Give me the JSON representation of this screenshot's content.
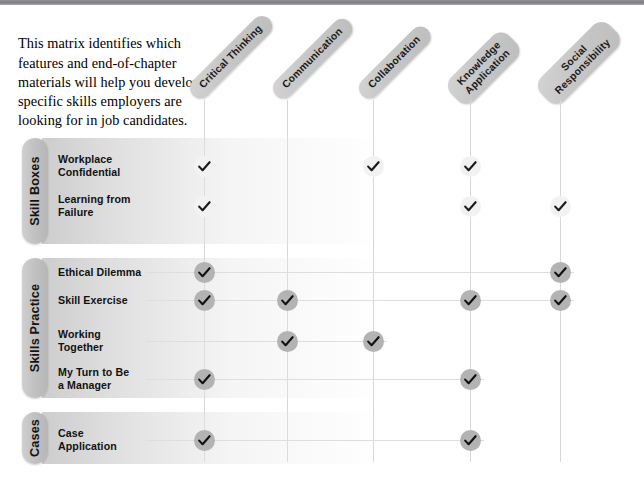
{
  "intro": {
    "text": "This matrix identifies which features and end-of-chapter materials will help you develop specific skills employers are looking for in job candidates."
  },
  "matrix": {
    "columns": [
      {
        "id": "critical-thinking",
        "label": "Critical Thinking",
        "line2": ""
      },
      {
        "id": "communication",
        "label": "Communication",
        "line2": ""
      },
      {
        "id": "collaboration",
        "label": "Collaboration",
        "line2": ""
      },
      {
        "id": "knowledge-application",
        "label": "Knowledge",
        "line2": "Application"
      },
      {
        "id": "social-responsibility",
        "label": "Social",
        "line2": "Responsibility"
      }
    ],
    "groups": [
      {
        "id": "skill-boxes",
        "label": "Skill Boxes"
      },
      {
        "id": "skills-practice",
        "label": "Skills Practice"
      },
      {
        "id": "cases",
        "label": "Cases"
      }
    ],
    "rows": [
      {
        "id": "workplace-confidential",
        "group": "skill-boxes",
        "label": "Workplace",
        "line2": "Confidential",
        "checks": [
          true,
          false,
          true,
          true,
          false
        ]
      },
      {
        "id": "learning-from-failure",
        "group": "skill-boxes",
        "label": "Learning from",
        "line2": "Failure",
        "checks": [
          true,
          false,
          false,
          true,
          true
        ]
      },
      {
        "id": "ethical-dilemma",
        "group": "skills-practice",
        "label": "Ethical Dilemma",
        "line2": "",
        "checks": [
          true,
          false,
          false,
          false,
          true
        ]
      },
      {
        "id": "skill-exercise",
        "group": "skills-practice",
        "label": "Skill Exercise",
        "line2": "",
        "checks": [
          true,
          true,
          false,
          true,
          true
        ]
      },
      {
        "id": "working-together",
        "group": "skills-practice",
        "label": "Working",
        "line2": "Together",
        "checks": [
          false,
          true,
          true,
          false,
          false
        ]
      },
      {
        "id": "my-turn-to-be-a-manager",
        "group": "skills-practice",
        "label": "My Turn to Be",
        "line2": "a Manager",
        "checks": [
          true,
          false,
          false,
          true,
          false
        ]
      },
      {
        "id": "case-application",
        "group": "cases",
        "label": "Case",
        "line2": "Application",
        "checks": [
          true,
          false,
          false,
          true,
          false
        ]
      }
    ],
    "check_glyph": "✓",
    "colors": {
      "pill_gray": "#c8c8c8",
      "tab_gray": "#c2c2c2",
      "check_light": "#f2f2f2",
      "check_dark": "#b3b3b3",
      "grid_line": "#d6d8da",
      "top_rule": "#7c7e81"
    }
  }
}
